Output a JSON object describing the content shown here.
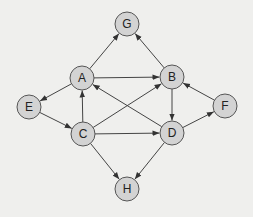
{
  "diagram": {
    "type": "directed-graph",
    "colors": {
      "background": "#efefed",
      "node_fill": "#d3d3d3",
      "node_stroke": "#555555",
      "edge": "#444444",
      "label": "#222222"
    },
    "node_radius": 12,
    "nodes": [
      {
        "id": "G",
        "label": "G",
        "x": 127,
        "y": 24
      },
      {
        "id": "A",
        "label": "A",
        "x": 82,
        "y": 78
      },
      {
        "id": "B",
        "label": "B",
        "x": 172,
        "y": 77
      },
      {
        "id": "E",
        "label": "E",
        "x": 29,
        "y": 107
      },
      {
        "id": "F",
        "label": "F",
        "x": 225,
        "y": 106
      },
      {
        "id": "C",
        "label": "C",
        "x": 83,
        "y": 134
      },
      {
        "id": "D",
        "label": "D",
        "x": 172,
        "y": 133
      },
      {
        "id": "H",
        "label": "H",
        "x": 127,
        "y": 189
      }
    ],
    "edges": [
      {
        "from": "A",
        "to": "G"
      },
      {
        "from": "B",
        "to": "G"
      },
      {
        "from": "A",
        "to": "B"
      },
      {
        "from": "A",
        "to": "E"
      },
      {
        "from": "E",
        "to": "C"
      },
      {
        "from": "C",
        "to": "A"
      },
      {
        "from": "D",
        "to": "A"
      },
      {
        "from": "C",
        "to": "B"
      },
      {
        "from": "B",
        "to": "D"
      },
      {
        "from": "F",
        "to": "B"
      },
      {
        "from": "D",
        "to": "F"
      },
      {
        "from": "C",
        "to": "D"
      },
      {
        "from": "C",
        "to": "H"
      },
      {
        "from": "D",
        "to": "H"
      }
    ]
  }
}
